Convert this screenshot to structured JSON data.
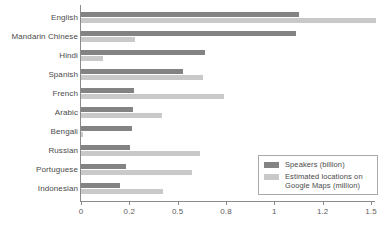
{
  "chart_data": {
    "type": "bar",
    "orientation": "horizontal",
    "title": "",
    "xlabel": "",
    "ylabel": "",
    "grid": false,
    "legend_position": "bottom-right",
    "xlim": [
      0,
      1.6
    ],
    "xticks": [
      0,
      0.2,
      0.5,
      0.8,
      1,
      1.2,
      1.5
    ],
    "xtick_labels": [
      "0",
      "0.2",
      "0.5",
      "0.8",
      "1",
      "1.2",
      "1.5"
    ],
    "tick_spacing": "even (non-linear value spacing)",
    "categories": [
      "English",
      "Mandarin Chinese",
      "Hindi",
      "Spanish",
      "French",
      "Arabic",
      "Bengali",
      "Russian",
      "Portuguese",
      "Indonesian"
    ],
    "series": [
      {
        "name": "Speakers (billion)",
        "color": "#838383",
        "values": [
          1.1,
          1.09,
          0.67,
          0.53,
          0.23,
          0.22,
          0.215,
          0.205,
          0.185,
          0.16
        ]
      },
      {
        "name": "Estimated locations on Google Maps (million)",
        "color": "#c9c9c9",
        "values": [
          1.53,
          0.235,
          0.09,
          0.66,
          0.79,
          0.4,
          0.01,
          0.64,
          0.59,
          0.41
        ]
      }
    ]
  },
  "legend": {
    "items": [
      {
        "label": "Speakers (billion)",
        "color": "#838383"
      },
      {
        "label": "Estimated locations on\nGoogle Maps (million)",
        "color": "#c9c9c9"
      }
    ]
  }
}
